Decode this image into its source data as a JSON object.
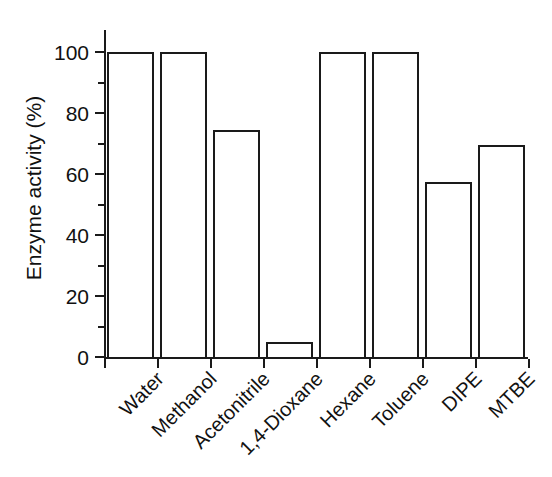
{
  "chart_data": {
    "type": "bar",
    "title": "",
    "subtitle": "",
    "xlabel": "",
    "ylabel": "Enzyme activity (%)",
    "categories": [
      "Water",
      "Methanol",
      "Acetonitrile",
      "1,4-Dioxane",
      "Hexane",
      "Toluene",
      "DIPE",
      "MTBE"
    ],
    "values": [
      100,
      100,
      74.5,
      5,
      100,
      100,
      57.5,
      69.5
    ],
    "ylim": [
      0,
      100
    ],
    "xlim_note": "categorical, 8 contiguous bars",
    "ytick_major": [
      0,
      20,
      40,
      60,
      80,
      100
    ],
    "ytick_major_labels": [
      "0",
      "20",
      "40",
      "60",
      "80",
      "100"
    ],
    "ytick_minor": [
      10,
      30,
      50,
      70,
      90
    ],
    "grid": false,
    "legend": false,
    "legend_position": "none",
    "bar_fill_color": "#ffffff",
    "bar_edge_color": "#1a1a1a",
    "axis_color": "#1a1a1a",
    "background_color": "#ffffff",
    "xlabel_rotation_degrees": 45,
    "spines": "left and bottom only"
  }
}
